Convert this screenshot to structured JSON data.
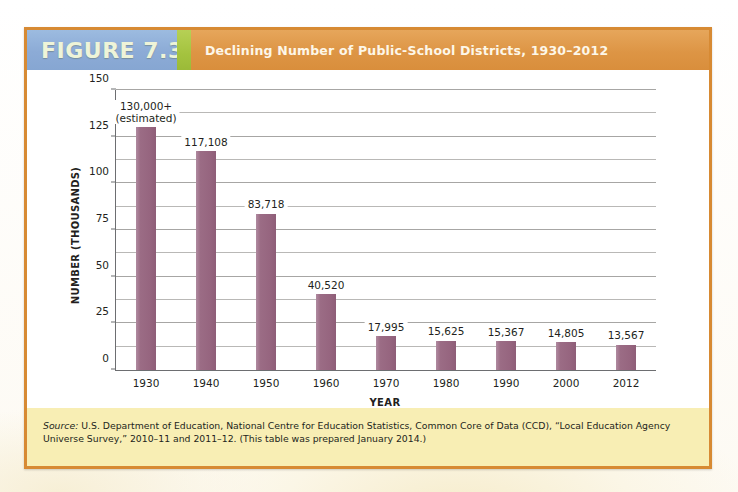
{
  "figure": {
    "tag": "FIGURE 7.3",
    "title": "Declining Number of Public-School Districts, 1930–2012",
    "source_lead": "Source:",
    "source_body": " U.S. Department of Education, National Centre for Education Statistics, Common Core of Data (CCD), “Local Education Agency Universe Survey,” 2010–11 and 2011–12. (This table was prepared January 2014.)"
  },
  "colors": {
    "header_orange": "#dd9545",
    "tag_blue": "#8cabd6",
    "divider_green": "#a4c33f",
    "bar_plum": "#96657f",
    "source_yellow": "#f8eeb4",
    "frame_orange": "#d78a33",
    "gridline_gray": "#b9b8b6",
    "axis_gray": "#6d6e71",
    "text_black": "#231f20"
  },
  "chart_data": {
    "type": "bar",
    "title": "Declining Number of Public-School Districts, 1930–2012",
    "xlabel": "YEAR",
    "ylabel": "NUMBER (THOUSANDS)",
    "categories": [
      "1930",
      "1940",
      "1950",
      "1960",
      "1970",
      "1980",
      "1990",
      "2000",
      "2012"
    ],
    "values": [
      130.0,
      117.108,
      83.718,
      40.52,
      17.995,
      15.625,
      15.367,
      14.805,
      13.567
    ],
    "data_labels": [
      "130,000+\n(estimated)",
      "117,108",
      "83,718",
      "40,520",
      "17,995",
      "15,625",
      "15,367",
      "14,805",
      "13,567"
    ],
    "label_line1": [
      "130,000+",
      "117,108",
      "83,718",
      "40,520",
      "17,995",
      "15,625",
      "15,367",
      "14,805",
      "13,567"
    ],
    "label_line2": [
      "(estimated)",
      "",
      "",
      "",
      "",
      "",
      "",
      "",
      ""
    ],
    "ylim": [
      0,
      150
    ],
    "y_major_ticks": [
      0,
      25,
      50,
      75,
      100,
      125,
      150
    ],
    "y_minor_ticks": [
      12.5,
      37.5,
      62.5,
      87.5,
      112.5,
      137.5
    ],
    "y_tick_labels": [
      "0",
      "25",
      "50",
      "75",
      "100",
      "125",
      "150"
    ],
    "grid": true,
    "legend": false,
    "units": "thousands of districts"
  }
}
